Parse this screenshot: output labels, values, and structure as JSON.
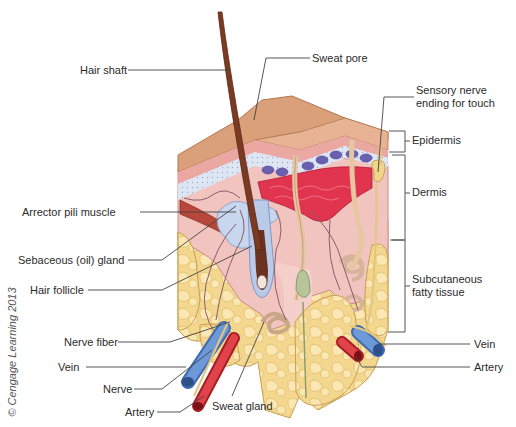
{
  "diagram": {
    "labels": {
      "hair_shaft": "Hair shaft",
      "sweat_pore": "Sweat pore",
      "sensory_nerve": "Sensory nerve ending for touch",
      "epidermis": "Epidermis",
      "dermis": "Dermis",
      "subcutaneous": "Subcutaneous fatty tissue",
      "arrector_pili": "Arrector pili muscle",
      "sebaceous": "Sebaceous (oil) gland",
      "hair_follicle": "Hair follicle",
      "nerve_fiber": "Nerve fiber",
      "vein_left": "Vein",
      "nerve": "Nerve",
      "artery_left": "Artery",
      "sweat_gland": "Sweat gland",
      "vein_right": "Vein",
      "artery_right": "Artery"
    },
    "copyright": "© Cengage Learning 2013",
    "colors": {
      "epidermis_surface": "#d9a07a",
      "dermis": "#f2c4c0",
      "fat": "#f5d98e",
      "vein": "#5b86c9",
      "artery": "#d8343a",
      "hair": "#7a3b22",
      "blood_plexus": "#e0344f",
      "basal_layer": "#6b5fb0"
    }
  }
}
